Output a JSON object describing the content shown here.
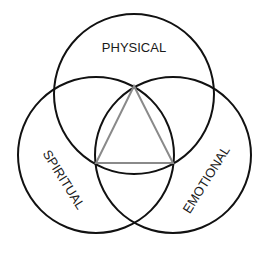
{
  "diagram": {
    "type": "venn",
    "sets": [
      {
        "id": "physical",
        "label": "PHYSICAL"
      },
      {
        "id": "spiritual",
        "label": "SPIRITUAL"
      },
      {
        "id": "emotional",
        "label": "EMOTIONAL"
      }
    ],
    "center_shape": "triangle",
    "colors": {
      "circle_stroke": "#111111",
      "triangle_stroke": "#8a8a8a",
      "label": "#1a1a1a",
      "background": "#ffffff"
    }
  }
}
